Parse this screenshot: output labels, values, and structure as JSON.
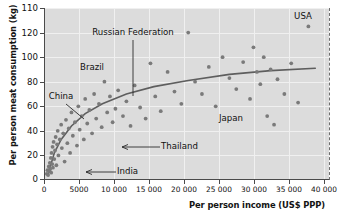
{
  "chart_data": {
    "type": "scatter",
    "title": "",
    "xlabel": "Per person income (US$ PPP)",
    "ylabel": "Per person meat consumption (kg)",
    "xlim": [
      0,
      41500
    ],
    "ylim": [
      0,
      140
    ],
    "grid": true,
    "legend": null,
    "x_ticks": [
      "0",
      "5000",
      "10 000",
      "15 000",
      "20 000",
      "25 000",
      "30 000",
      "35 000",
      "40 000"
    ],
    "x_tick_values": [
      0,
      5000,
      10000,
      15000,
      20000,
      25000,
      30000,
      35000,
      40000
    ],
    "y_ticks": [
      "110",
      "120",
      "100",
      "80",
      "60",
      "40",
      "20",
      "0"
    ],
    "y_tick_values": [
      140,
      120,
      100,
      80,
      60,
      40,
      20,
      0
    ],
    "points": [
      {
        "x": 400,
        "y": 5
      },
      {
        "x": 500,
        "y": 8
      },
      {
        "x": 600,
        "y": 4
      },
      {
        "x": 700,
        "y": 11
      },
      {
        "x": 800,
        "y": 7
      },
      {
        "x": 850,
        "y": 14
      },
      {
        "x": 900,
        "y": 9
      },
      {
        "x": 1000,
        "y": 18
      },
      {
        "x": 1050,
        "y": 6
      },
      {
        "x": 1100,
        "y": 22
      },
      {
        "x": 1200,
        "y": 13
      },
      {
        "x": 1250,
        "y": 27
      },
      {
        "x": 1300,
        "y": 10
      },
      {
        "x": 1400,
        "y": 31
      },
      {
        "x": 1500,
        "y": 17
      },
      {
        "x": 1600,
        "y": 24
      },
      {
        "x": 1700,
        "y": 35
      },
      {
        "x": 1800,
        "y": 12
      },
      {
        "x": 1900,
        "y": 29
      },
      {
        "x": 2000,
        "y": 40
      },
      {
        "x": 2100,
        "y": 20
      },
      {
        "x": 2300,
        "y": 33
      },
      {
        "x": 2500,
        "y": 45
      },
      {
        "x": 2600,
        "y": 26
      },
      {
        "x": 2800,
        "y": 38
      },
      {
        "x": 3000,
        "y": 15
      },
      {
        "x": 3200,
        "y": 49
      },
      {
        "x": 3400,
        "y": 30
      },
      {
        "x": 3600,
        "y": 42
      },
      {
        "x": 3800,
        "y": 22
      },
      {
        "x": 4000,
        "y": 55
      },
      {
        "x": 4200,
        "y": 36
      },
      {
        "x": 4500,
        "y": 47
      },
      {
        "x": 4800,
        "y": 28
      },
      {
        "x": 5000,
        "y": 60
      },
      {
        "x": 5200,
        "y": 41
      },
      {
        "x": 5500,
        "y": 52
      },
      {
        "x": 5800,
        "y": 33
      },
      {
        "x": 6000,
        "y": 66
      },
      {
        "x": 6300,
        "y": 46
      },
      {
        "x": 6600,
        "y": 57
      },
      {
        "x": 7000,
        "y": 38
      },
      {
        "x": 7300,
        "y": 70
      },
      {
        "x": 7600,
        "y": 50
      },
      {
        "x": 8000,
        "y": 62
      },
      {
        "x": 8400,
        "y": 43
      },
      {
        "x": 8800,
        "y": 80
      },
      {
        "x": 9200,
        "y": 55
      },
      {
        "x": 9600,
        "y": 68
      },
      {
        "x": 10000,
        "y": 47
      },
      {
        "x": 10400,
        "y": 58
      },
      {
        "x": 10800,
        "y": 73
      },
      {
        "x": 11500,
        "y": 52
      },
      {
        "x": 12000,
        "y": 64
      },
      {
        "x": 12600,
        "y": 44
      },
      {
        "x": 13200,
        "y": 77
      },
      {
        "x": 14000,
        "y": 59
      },
      {
        "x": 14800,
        "y": 50
      },
      {
        "x": 15500,
        "y": 95
      },
      {
        "x": 16200,
        "y": 68
      },
      {
        "x": 17000,
        "y": 56
      },
      {
        "x": 18000,
        "y": 88
      },
      {
        "x": 19000,
        "y": 72
      },
      {
        "x": 20000,
        "y": 62
      },
      {
        "x": 21000,
        "y": 120
      },
      {
        "x": 22000,
        "y": 80
      },
      {
        "x": 23000,
        "y": 70
      },
      {
        "x": 24000,
        "y": 92
      },
      {
        "x": 25000,
        "y": 60
      },
      {
        "x": 26000,
        "y": 100
      },
      {
        "x": 27000,
        "y": 83
      },
      {
        "x": 28000,
        "y": 74
      },
      {
        "x": 29000,
        "y": 96
      },
      {
        "x": 30000,
        "y": 66
      },
      {
        "x": 30500,
        "y": 108
      },
      {
        "x": 31000,
        "y": 88
      },
      {
        "x": 31500,
        "y": 78
      },
      {
        "x": 32000,
        "y": 100
      },
      {
        "x": 32500,
        "y": 52
      },
      {
        "x": 33000,
        "y": 90
      },
      {
        "x": 33500,
        "y": 45
      },
      {
        "x": 34000,
        "y": 82
      },
      {
        "x": 35000,
        "y": 70
      },
      {
        "x": 36000,
        "y": 95
      },
      {
        "x": 37000,
        "y": 63
      },
      {
        "x": 38500,
        "y": 125
      }
    ],
    "trend_line": {
      "label": "fitted logarithmic trend",
      "points": [
        {
          "x": 600,
          "y": 5
        },
        {
          "x": 1500,
          "y": 22
        },
        {
          "x": 2500,
          "y": 33
        },
        {
          "x": 4000,
          "y": 44
        },
        {
          "x": 6000,
          "y": 54
        },
        {
          "x": 8500,
          "y": 62
        },
        {
          "x": 12000,
          "y": 70
        },
        {
          "x": 16000,
          "y": 76
        },
        {
          "x": 21000,
          "y": 81
        },
        {
          "x": 27000,
          "y": 86
        },
        {
          "x": 33000,
          "y": 89
        },
        {
          "x": 39500,
          "y": 91
        }
      ]
    },
    "annotations": [
      {
        "label": "USA",
        "x": 38500,
        "y": 125,
        "placement": "above"
      },
      {
        "label": "Russian Federation",
        "x": 15500,
        "y": 95,
        "placement": "above-leader"
      },
      {
        "label": "Brazil",
        "x": 10800,
        "y": 73,
        "placement": "above"
      },
      {
        "label": "China",
        "x": 5500,
        "y": 52,
        "placement": "left-leader"
      },
      {
        "label": "Japan",
        "x": 30000,
        "y": 45,
        "placement": "above"
      },
      {
        "label": "Thailand",
        "x": 9600,
        "y": 27,
        "placement": "right-arrow"
      },
      {
        "label": "India",
        "x": 3000,
        "y": 6,
        "placement": "right-arrow"
      }
    ]
  }
}
